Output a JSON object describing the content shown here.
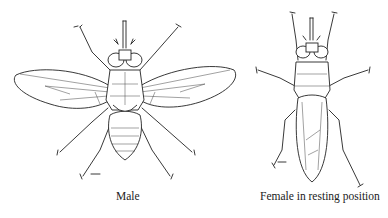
{
  "figure": {
    "panels": [
      {
        "id": "male",
        "caption": "Male",
        "icon": "fly-male-wings-spread-illustration"
      },
      {
        "id": "female",
        "caption": "Female in resting position",
        "icon": "fly-female-wings-folded-illustration"
      }
    ],
    "scale_bar_icon": "scale-bar-icon"
  }
}
